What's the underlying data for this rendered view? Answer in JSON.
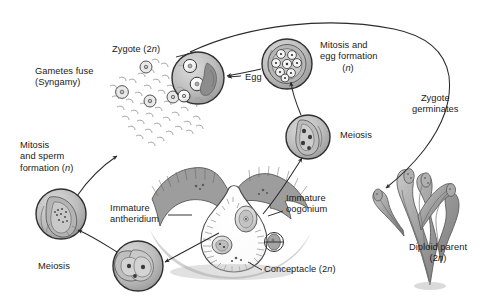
{
  "diagram": {
    "organism": "Diploid parent seaweed (Fucus)",
    "type": "biological-life-cycle",
    "colors": {
      "line": "#2b2b2b",
      "text": "#1a1a1a",
      "cell_fill": "#b9b9b9",
      "cell_fill_light": "#d2d2d2",
      "cell_outline": "#3a3a3a",
      "tissue": "#8e8e8e",
      "background": "#ffffff"
    }
  },
  "labels": {
    "zygote": {
      "text": "Zygote (2",
      "italic_n": "n",
      "tail": ")",
      "full": "Zygote (2n)"
    },
    "gametes_fuse": {
      "line1": "Gametes fuse",
      "line2": "(Syngamy)",
      "full": "Gametes fuse (Syngamy)"
    },
    "mitosis_sperm": {
      "line1": "Mitosis",
      "line2": "and sperm",
      "line3": "formation (",
      "italic_n": "n",
      "tail": ")",
      "full": "Mitosis and sperm formation (n)"
    },
    "meiosis_left": {
      "text": "Meiosis"
    },
    "immature_antheridium": {
      "line1": "Immature",
      "line2": "antheridium",
      "full": "Immature antheridium"
    },
    "egg": {
      "text": "Egg"
    },
    "mitosis_egg": {
      "line1": "Mitosis and",
      "line2": "egg formation",
      "line3_italic": "n",
      "full": "Mitosis and egg formation (n)"
    },
    "meiosis_right": {
      "text": "Meiosis"
    },
    "zygote_germinates": {
      "line1": "Zygote",
      "line2": "germinates",
      "full": "Zygote germinates"
    },
    "immature_oogonium": {
      "line1": "Immature",
      "line2": "oogonium",
      "full": "Immature oogonium"
    },
    "conceptacle": {
      "text": "Conceptacle (2",
      "italic_n": "n",
      "tail": ")",
      "full": "Conceptacle (2n)"
    },
    "diploid_parent": {
      "line1": "Diploid parent",
      "line2_prefix": "(2",
      "italic_n": "n",
      "tail": ")",
      "full": "Diploid parent (2n)"
    }
  },
  "stages": [
    {
      "name": "egg-cell-inset",
      "ploidy": "n",
      "contents": "released eggs with attached sperm"
    },
    {
      "name": "mitosis-egg-formation-inset",
      "ploidy": "n",
      "contents": "oogonium containing eight eggs"
    },
    {
      "name": "meiosis-oogonium-inset",
      "ploidy": "2n",
      "contents": "oogonium undergoing meiosis"
    },
    {
      "name": "zygote-inset",
      "ploidy": "2n",
      "contents": "fertilized zygotes among sperm"
    },
    {
      "name": "mitosis-sperm-formation-inset",
      "ploidy": "n",
      "contents": "antheridium releasing sperm"
    },
    {
      "name": "meiosis-antheridium-inset",
      "ploidy": "2n",
      "contents": "immature antheridium undergoing meiosis"
    },
    {
      "name": "conceptacle",
      "ploidy": "2n",
      "contents": "flask-shaped cavity bearing oogonia and antheridia"
    },
    {
      "name": "diploid-parent-thallus",
      "ploidy": "2n",
      "contents": "branched seaweed thallus with receptacles"
    }
  ]
}
